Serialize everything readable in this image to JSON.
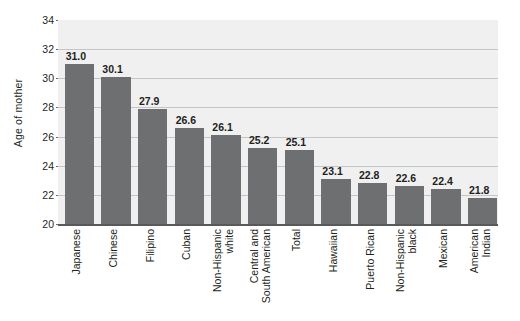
{
  "chart_data": {
    "type": "bar",
    "title": "",
    "xlabel": "",
    "ylabel": "Age of mother",
    "ylim": [
      20,
      34
    ],
    "yticks": [
      20,
      22,
      24,
      26,
      28,
      30,
      32,
      34
    ],
    "grid": true,
    "legend": "none",
    "orientation": "vertical",
    "bar_color": "#6e6f71",
    "plot_background": "#f0f0f0",
    "gridline_color": "#c4c5c7",
    "axis_color": "#58595b",
    "categories": [
      "Japanese",
      "Chinese",
      "Filipino",
      "Cuban",
      "Non-Hispanic white",
      "Central and South American",
      "Total",
      "Hawaiian",
      "Puerto Rican",
      "Non-Hispanic black",
      "Mexican",
      "American Indian"
    ],
    "category_lines": [
      [
        "Japanese"
      ],
      [
        "Chinese"
      ],
      [
        "Filipino"
      ],
      [
        "Cuban"
      ],
      [
        "Non-Hispanic",
        "white"
      ],
      [
        "Central and",
        "South American"
      ],
      [
        "Total"
      ],
      [
        "Hawaiian"
      ],
      [
        "Puerto Rican"
      ],
      [
        "Non-Hispanic",
        "black"
      ],
      [
        "Mexican"
      ],
      [
        "American",
        "Indian"
      ]
    ],
    "values": [
      31.0,
      30.1,
      27.9,
      26.6,
      26.1,
      25.2,
      25.1,
      23.1,
      22.8,
      22.6,
      22.4,
      21.8
    ],
    "value_labels": [
      "31.0",
      "30.1",
      "27.9",
      "26.6",
      "26.1",
      "25.2",
      "25.1",
      "23.1",
      "22.8",
      "22.6",
      "22.4",
      "21.8"
    ],
    "ytick_labels": [
      "20",
      "22",
      "24",
      "26",
      "28",
      "30",
      "32",
      "34"
    ]
  }
}
